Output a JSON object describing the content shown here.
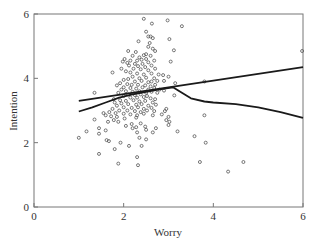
{
  "chart_data": {
    "type": "scatter",
    "title": "",
    "xlabel": "Worry",
    "ylabel": "Intention",
    "xlim": [
      0,
      6
    ],
    "ylim": [
      0,
      6
    ],
    "xticks": [
      0,
      2,
      4,
      6
    ],
    "yticks": [
      0,
      2,
      4,
      6
    ],
    "grid": false,
    "legend": null,
    "series": [
      {
        "name": "observations",
        "kind": "points",
        "marker": "open-circle",
        "points": [
          [
            2.45,
            5.85
          ],
          [
            2.98,
            5.8
          ],
          [
            3.3,
            5.62
          ],
          [
            2.63,
            5.7
          ],
          [
            2.5,
            5.45
          ],
          [
            2.55,
            5.3
          ],
          [
            2.6,
            5.3
          ],
          [
            2.65,
            5.25
          ],
          [
            2.33,
            5.15
          ],
          [
            2.58,
            5.1
          ],
          [
            3.02,
            5.22
          ],
          [
            2.55,
            4.98
          ],
          [
            2.65,
            4.92
          ],
          [
            2.7,
            4.85
          ],
          [
            2.1,
            4.85
          ],
          [
            2.27,
            4.82
          ],
          [
            3.12,
            4.87
          ],
          [
            2.5,
            4.75
          ],
          [
            2.6,
            4.7
          ],
          [
            2.45,
            4.72
          ],
          [
            2.2,
            4.7
          ],
          [
            2.35,
            4.65
          ],
          [
            2.02,
            4.6
          ],
          [
            2.15,
            4.55
          ],
          [
            2.3,
            4.55
          ],
          [
            2.4,
            4.58
          ],
          [
            2.5,
            4.6
          ],
          [
            2.68,
            4.55
          ],
          [
            1.98,
            4.52
          ],
          [
            2.08,
            4.48
          ],
          [
            2.25,
            4.45
          ],
          [
            2.42,
            4.45
          ],
          [
            2.55,
            4.5
          ],
          [
            3.05,
            4.52
          ],
          [
            2.12,
            4.4
          ],
          [
            2.32,
            4.38
          ],
          [
            2.48,
            4.35
          ],
          [
            2.62,
            4.4
          ],
          [
            1.95,
            4.3
          ],
          [
            2.22,
            4.3
          ],
          [
            2.38,
            4.28
          ],
          [
            2.55,
            4.25
          ],
          [
            2.7,
            4.3
          ],
          [
            2.05,
            4.22
          ],
          [
            2.15,
            4.18
          ],
          [
            1.75,
            4.18
          ],
          [
            2.3,
            4.15
          ],
          [
            2.45,
            4.12
          ],
          [
            2.62,
            4.15
          ],
          [
            2.78,
            4.12
          ],
          [
            2.88,
            4.1
          ],
          [
            3.0,
            4.05
          ],
          [
            2.2,
            4.05
          ],
          [
            2.35,
            4.0
          ],
          [
            2.5,
            4.02
          ],
          [
            2.68,
            4.0
          ],
          [
            2.1,
            3.98
          ],
          [
            2.0,
            3.95
          ],
          [
            2.25,
            3.9
          ],
          [
            2.4,
            3.92
          ],
          [
            2.55,
            3.88
          ],
          [
            2.62,
            3.9
          ],
          [
            2.75,
            3.92
          ],
          [
            2.9,
            3.92
          ],
          [
            3.15,
            3.85
          ],
          [
            1.92,
            3.85
          ],
          [
            2.08,
            3.82
          ],
          [
            2.18,
            3.8
          ],
          [
            2.32,
            3.8
          ],
          [
            2.48,
            3.78
          ],
          [
            2.6,
            3.75
          ],
          [
            2.7,
            3.8
          ],
          [
            1.85,
            3.78
          ],
          [
            2.0,
            3.72
          ],
          [
            2.15,
            3.7
          ],
          [
            2.28,
            3.68
          ],
          [
            2.42,
            3.72
          ],
          [
            2.55,
            3.65
          ],
          [
            2.68,
            3.7
          ],
          [
            2.8,
            3.65
          ],
          [
            2.9,
            3.62
          ],
          [
            1.95,
            3.65
          ],
          [
            2.05,
            3.6
          ],
          [
            2.2,
            3.58
          ],
          [
            2.35,
            3.6
          ],
          [
            2.5,
            3.55
          ],
          [
            2.62,
            3.58
          ],
          [
            2.75,
            3.55
          ],
          [
            1.88,
            3.55
          ],
          [
            1.35,
            3.55
          ],
          [
            2.1,
            3.5
          ],
          [
            2.25,
            3.48
          ],
          [
            2.38,
            3.5
          ],
          [
            2.52,
            3.45
          ],
          [
            3.13,
            3.47
          ],
          [
            2.0,
            3.45
          ],
          [
            2.15,
            3.4
          ],
          [
            2.3,
            3.4
          ],
          [
            2.45,
            3.42
          ],
          [
            2.6,
            3.38
          ],
          [
            2.7,
            3.35
          ],
          [
            1.78,
            3.35
          ],
          [
            1.92,
            3.32
          ],
          [
            2.05,
            3.3
          ],
          [
            2.22,
            3.32
          ],
          [
            2.35,
            3.28
          ],
          [
            2.48,
            3.3
          ],
          [
            2.65,
            3.25
          ],
          [
            1.8,
            3.25
          ],
          [
            1.95,
            3.22
          ],
          [
            2.1,
            3.2
          ],
          [
            2.28,
            3.18
          ],
          [
            2.4,
            3.2
          ],
          [
            2.55,
            3.15
          ],
          [
            2.72,
            3.18
          ],
          [
            1.85,
            3.15
          ],
          [
            2.0,
            3.1
          ],
          [
            2.18,
            3.08
          ],
          [
            2.32,
            3.1
          ],
          [
            2.45,
            3.05
          ],
          [
            2.62,
            3.08
          ],
          [
            2.95,
            3.05
          ],
          [
            1.75,
            3.05
          ],
          [
            1.9,
            3.0
          ],
          [
            2.08,
            3.0
          ],
          [
            2.25,
            2.98
          ],
          [
            2.38,
            2.95
          ],
          [
            2.52,
            3.0
          ],
          [
            2.68,
            2.98
          ],
          [
            2.92,
            2.98
          ],
          [
            1.55,
            2.92
          ],
          [
            1.68,
            2.95
          ],
          [
            1.82,
            2.92
          ],
          [
            2.0,
            2.9
          ],
          [
            2.15,
            2.88
          ],
          [
            2.3,
            2.85
          ],
          [
            2.45,
            2.9
          ],
          [
            2.65,
            2.85
          ],
          [
            2.85,
            2.88
          ],
          [
            3.0,
            2.8
          ],
          [
            1.6,
            2.85
          ],
          [
            1.72,
            2.82
          ],
          [
            1.85,
            2.8
          ],
          [
            2.28,
            2.78
          ],
          [
            2.02,
            2.75
          ],
          [
            1.78,
            2.7
          ],
          [
            1.35,
            2.72
          ],
          [
            1.65,
            2.65
          ],
          [
            1.88,
            2.65
          ],
          [
            2.95,
            2.7
          ],
          [
            3.02,
            2.65
          ],
          [
            2.18,
            2.58
          ],
          [
            2.38,
            2.6
          ],
          [
            2.05,
            2.52
          ],
          [
            2.48,
            2.5
          ],
          [
            3.0,
            2.55
          ],
          [
            2.28,
            2.48
          ],
          [
            2.2,
            2.45
          ],
          [
            1.45,
            2.45
          ],
          [
            1.6,
            2.38
          ],
          [
            2.5,
            2.4
          ],
          [
            2.72,
            2.45
          ],
          [
            2.65,
            2.32
          ],
          [
            2.3,
            2.32
          ],
          [
            1.17,
            2.35
          ],
          [
            3.2,
            2.35
          ],
          [
            1.45,
            2.28
          ],
          [
            1.0,
            2.15
          ],
          [
            1.62,
            2.08
          ],
          [
            1.67,
            2.05
          ],
          [
            1.93,
            2.0
          ],
          [
            2.35,
            2.15
          ],
          [
            2.5,
            2.1
          ],
          [
            2.12,
            1.9
          ],
          [
            2.4,
            1.9
          ],
          [
            1.8,
            1.8
          ],
          [
            1.45,
            1.65
          ],
          [
            2.3,
            1.55
          ],
          [
            1.88,
            1.35
          ],
          [
            2.32,
            1.3
          ],
          [
            5.98,
            4.85
          ],
          [
            3.8,
            3.9
          ],
          [
            3.8,
            2.85
          ],
          [
            3.58,
            2.2
          ],
          [
            3.83,
            2.0
          ],
          [
            3.7,
            1.4
          ],
          [
            4.67,
            1.4
          ],
          [
            4.33,
            1.1
          ]
        ]
      },
      {
        "name": "linear fit",
        "kind": "line",
        "points": [
          [
            1.0,
            3.3
          ],
          [
            6.0,
            4.35
          ]
        ]
      },
      {
        "name": "loess smooth",
        "kind": "line",
        "points": [
          [
            1.0,
            2.97
          ],
          [
            1.3,
            3.1
          ],
          [
            1.6,
            3.25
          ],
          [
            1.9,
            3.4
          ],
          [
            2.2,
            3.5
          ],
          [
            2.5,
            3.58
          ],
          [
            2.8,
            3.66
          ],
          [
            3.1,
            3.72
          ],
          [
            3.3,
            3.55
          ],
          [
            3.5,
            3.38
          ],
          [
            3.8,
            3.28
          ],
          [
            4.0,
            3.25
          ],
          [
            4.5,
            3.2
          ],
          [
            5.0,
            3.1
          ],
          [
            5.5,
            2.95
          ],
          [
            6.0,
            2.77
          ]
        ]
      }
    ]
  },
  "axes": {
    "x_label": "Worry",
    "y_label": "Intention",
    "x_tick_labels": [
      "0",
      "2",
      "4",
      "6"
    ],
    "y_tick_labels": [
      "0",
      "2",
      "4",
      "6"
    ]
  },
  "colors": {
    "axis": "#777777",
    "points": "#555555",
    "lines": "#1a1a1a"
  }
}
